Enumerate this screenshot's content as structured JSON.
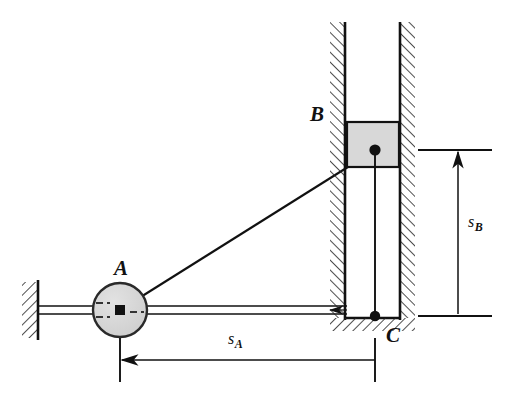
{
  "figure": {
    "type": "mechanism-kinematics-diagram",
    "background_color": "#ffffff",
    "line_color": "#111111",
    "fill_gray": "#d8d8d8",
    "hatch_color": "#222222"
  },
  "labels": {
    "point_a": "A",
    "point_b": "B",
    "point_c": "C",
    "dim_sa_base": "s",
    "dim_sa_sub": "A",
    "dim_sb_base": "s",
    "dim_sb_sub": "B"
  },
  "geometry": {
    "pulley_a": {
      "cx": 120,
      "cy": 310,
      "r": 27
    },
    "pin_b": {
      "x": 375,
      "y": 150
    },
    "point_c": {
      "x": 375,
      "y": 316
    },
    "channel": {
      "left_wall_x": 345,
      "right_wall_x": 400,
      "top_y": 22,
      "bottom_y": 318
    },
    "block_b": {
      "x": 348,
      "y": 122,
      "width": 50,
      "height": 45
    },
    "left_support": {
      "x": 38,
      "top_y": 282,
      "bottom_y": 338
    },
    "cable_horizontal_y": [
      306,
      314
    ],
    "dim_sa": {
      "y": 360,
      "x_from": 120,
      "x_to": 375
    },
    "dim_sb": {
      "x": 458,
      "y_from": 150,
      "y_to": 316
    }
  },
  "annotations": {
    "figure_caption": ""
  }
}
